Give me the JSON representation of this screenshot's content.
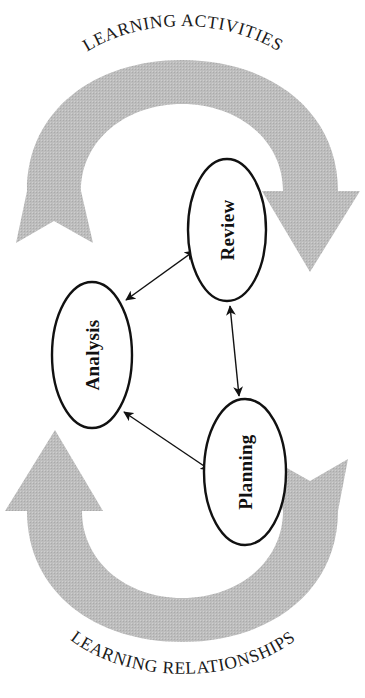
{
  "diagram": {
    "background_color": "#ffffff",
    "outline_color": "#111111",
    "band_color": "#b9b9b9",
    "arrow_color": "#111111",
    "cycle_labels": {
      "top": "LEARNING ACTIVITIES",
      "bottom": "LEARNING RELATIONSHIPS"
    },
    "nodes": [
      {
        "id": "review",
        "label": "Review",
        "cx": 227,
        "cy": 230,
        "rx": 39,
        "ry": 71
      },
      {
        "id": "analysis",
        "label": "Analysis",
        "cx": 92,
        "cy": 355,
        "rx": 40,
        "ry": 73
      },
      {
        "id": "planning",
        "label": "Planning",
        "cx": 245,
        "cy": 472,
        "rx": 41,
        "ry": 73
      }
    ],
    "connectors": [
      {
        "id": "analysis-review",
        "from": "analysis",
        "to": "review",
        "style": "double-headed"
      },
      {
        "id": "review-planning",
        "from": "review",
        "to": "planning",
        "style": "double-headed"
      },
      {
        "id": "analysis-planning",
        "from": "analysis",
        "to": "planning",
        "style": "double-headed"
      }
    ],
    "band_arrows": [
      {
        "id": "upper-band-arrow",
        "direction": "clockwise",
        "tail_side": "left",
        "head_side": "right",
        "description": "Wide grey band sweeping over the top from lower-left up and over to the right, ending in a downward arrowhead"
      },
      {
        "id": "lower-band-arrow",
        "direction": "clockwise",
        "tail_side": "right",
        "head_side": "left",
        "description": "Wide grey band sweeping under the bottom from lower-right around to the left, ending in an upward arrowhead"
      }
    ]
  }
}
